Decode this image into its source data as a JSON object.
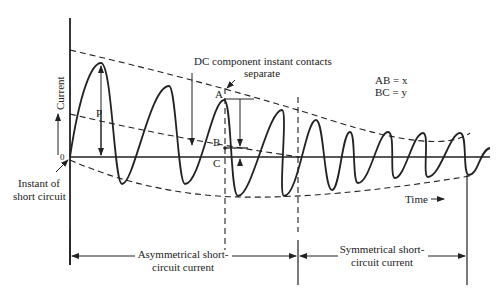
{
  "diagram": {
    "title_annotation": {
      "line1": "DC component instant contacts",
      "line2": "separate"
    },
    "legend": {
      "ab": "AB = x",
      "bc": "BC = y"
    },
    "axes": {
      "y_label": "Current",
      "x_label": "Time",
      "origin_label": "0"
    },
    "points": {
      "p": "P",
      "a": "A",
      "b": "B",
      "c": "C"
    },
    "instant_label": {
      "line1": "Instant of",
      "line2": "short circuit"
    },
    "regions": {
      "asymmetrical": {
        "line1": "Asymmetrical short-",
        "line2": "circuit current"
      },
      "symmetrical": {
        "line1": "Symmetrical short-",
        "line2": "circuit current"
      }
    },
    "colors": {
      "ink": "#222222",
      "background": "#ffffff"
    }
  }
}
